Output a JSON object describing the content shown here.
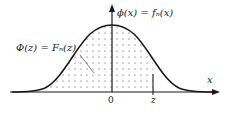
{
  "diagram": {
    "type": "normal-distribution",
    "labels": {
      "pdf": "ϕ(x) = fₙ(x)",
      "cdf": "Φ(z) = Fₙ(z)",
      "x_axis": "x",
      "origin": "0",
      "z_mark": "z"
    },
    "shading": "dotted area under curve from -∞ to z",
    "colors": {
      "line": "#1a1a1a",
      "dots": "#333333",
      "background": "#ffffff"
    }
  }
}
